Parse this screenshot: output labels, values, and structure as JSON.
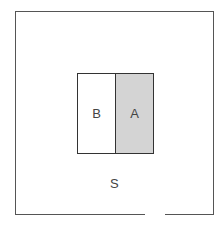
{
  "diagram": {
    "type": "venn-style set diagram",
    "universal_set": {
      "label": "S"
    },
    "regions": [
      {
        "label": "B",
        "fill": "#ffffff"
      },
      {
        "label": "A",
        "fill": "#d4d4d4"
      }
    ]
  }
}
